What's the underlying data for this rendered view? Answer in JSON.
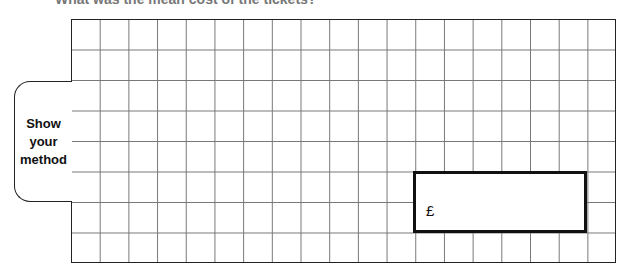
{
  "question": {
    "partial_text": "What was the mean cost of the tickets?"
  },
  "working_area": {
    "columns": 19,
    "rows": 8
  },
  "method_tab": {
    "lines": [
      "Show",
      "your",
      "method"
    ]
  },
  "answer_box": {
    "currency_symbol": "£",
    "value": ""
  }
}
